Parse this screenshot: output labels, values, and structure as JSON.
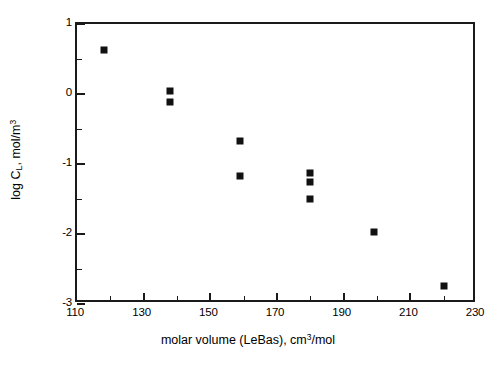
{
  "chart_data": {
    "type": "scatter",
    "title": "",
    "xlabel": "molar volume (LeBas), cm³/mol",
    "ylabel": "log Cʟ, mol/m³",
    "xlim": [
      110,
      230
    ],
    "ylim": [
      -3,
      1
    ],
    "grid": false,
    "legend": null,
    "x_major_ticks": [
      110,
      130,
      150,
      170,
      190,
      210,
      230
    ],
    "x_minor_ticks": [
      120,
      140,
      160,
      180,
      200,
      220
    ],
    "y_major_ticks": [
      1,
      0,
      -1,
      -2,
      -3
    ],
    "y_minor_ticks": [
      0.5,
      -0.5,
      -1.5,
      -2.5
    ],
    "x_tick_labels": [
      "110",
      "130",
      "150",
      "170",
      "190",
      "210",
      "230"
    ],
    "y_tick_labels": [
      "1",
      "0",
      "-1",
      "-2",
      "-3"
    ],
    "marker": "filled-square",
    "marker_color": "#111111",
    "points": [
      {
        "x": 118,
        "y": 0.63
      },
      {
        "x": 138,
        "y": 0.04
      },
      {
        "x": 138,
        "y": -0.11
      },
      {
        "x": 159,
        "y": -0.67
      },
      {
        "x": 159,
        "y": -1.17
      },
      {
        "x": 180,
        "y": -1.13
      },
      {
        "x": 180,
        "y": -1.25
      },
      {
        "x": 180,
        "y": -1.5
      },
      {
        "x": 199,
        "y": -1.97
      },
      {
        "x": 220,
        "y": -2.74
      }
    ]
  },
  "axes": {
    "x_title_parts": {
      "before": "molar volume (LeBas), cm",
      "sup": "3",
      "after": "/mol"
    },
    "y_title_parts": {
      "before": "log C",
      "sub": "L",
      "mid": ", mol/m",
      "sup": "3"
    }
  },
  "caption": {
    "partial_text": ""
  }
}
